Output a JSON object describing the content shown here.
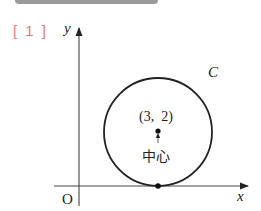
{
  "problem": {
    "number_label": "[ 1 ]"
  },
  "diagram": {
    "axes": {
      "x_label": "x",
      "y_label": "y",
      "origin_label": "O"
    },
    "circle": {
      "name": "C",
      "center_label": "(3,  2)",
      "center_caption": "中心",
      "center": [
        3,
        2
      ],
      "radius": 2,
      "tangent_to": "x-axis"
    },
    "colors": {
      "line": "#222222",
      "number_label": "#e07a78",
      "top_bar": "#9a9a9a"
    }
  }
}
